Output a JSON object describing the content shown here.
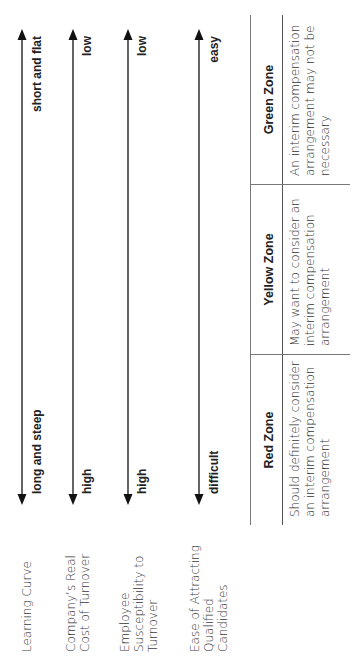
{
  "rows": [
    {
      "label": "Learning Curve",
      "left": "long and steep",
      "right": "short and flat"
    },
    {
      "label": "Company’s Real Cost of Turnover",
      "left": "high",
      "right": "low"
    },
    {
      "label": "Employee Susceptibility to Turnover",
      "left": "high",
      "right": "low"
    },
    {
      "label": "Ease of Attracting Qualified Candidates",
      "left": "difficult",
      "right": "easy"
    }
  ],
  "zones": [
    {
      "title": "Red Zone",
      "description": "Should definitely consider an interim compensation arrangement"
    },
    {
      "title": "Yellow Zone",
      "description": "May want to consider an interim compensation arrangement"
    },
    {
      "title": "Green Zone",
      "description": "An interim compensation arrangement may not be necessary"
    }
  ],
  "icons": {
    "arrow": "double-headed-arrow-icon"
  },
  "colors": {
    "text": "#2a2a2a",
    "rule": "#777777",
    "arrow": "#111111"
  }
}
